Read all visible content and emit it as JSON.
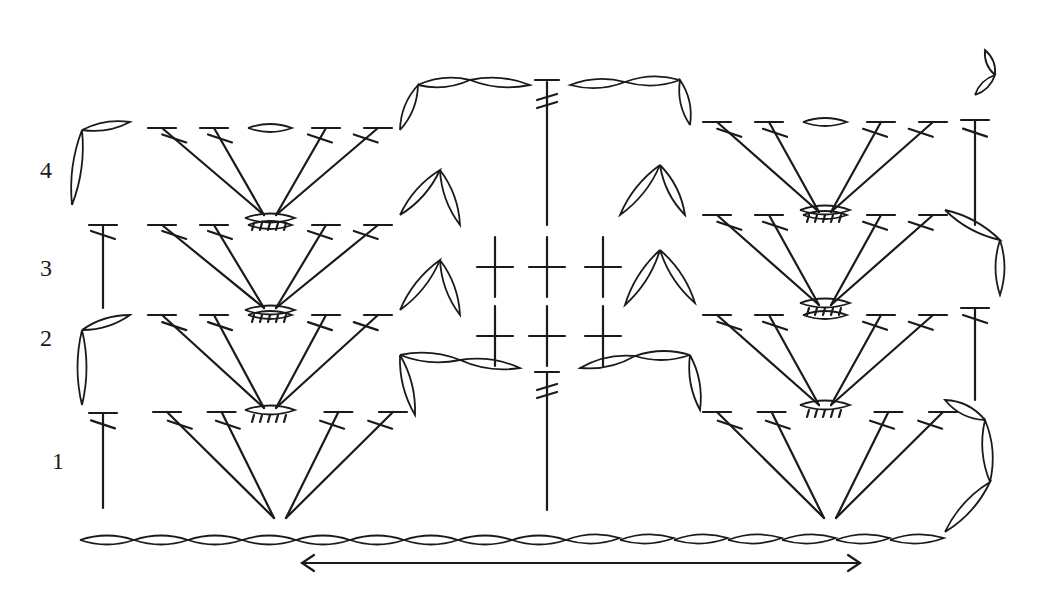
{
  "diagram": {
    "type": "crochet-stitch-chart",
    "row_labels": [
      {
        "text": "4",
        "x": 40,
        "y": 157
      },
      {
        "text": "3",
        "x": 40,
        "y": 255
      },
      {
        "text": "2",
        "x": 40,
        "y": 325
      },
      {
        "text": "1",
        "x": 52,
        "y": 448
      }
    ],
    "foundation_chain": {
      "start_x": 80,
      "y": 540,
      "count": 16,
      "loop_width": 54
    },
    "direction_arrow": {
      "x1": 302,
      "x2": 860,
      "y": 563,
      "bidirectional": true
    },
    "colors": {
      "ink": "#1a1a1a",
      "background": "#ffffff"
    }
  }
}
